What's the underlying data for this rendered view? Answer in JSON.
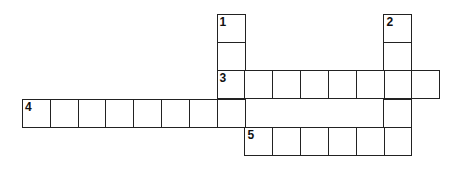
{
  "puzzle": {
    "type": "crossword",
    "grid_rows": 5,
    "grid_cols": 15,
    "entries": [
      {
        "number": "1",
        "direction": "down",
        "start_row": 0,
        "start_col": 7,
        "length": 4
      },
      {
        "number": "2",
        "direction": "down",
        "start_row": 0,
        "start_col": 13,
        "length": 5
      },
      {
        "number": "3",
        "direction": "across",
        "start_row": 2,
        "start_col": 7,
        "length": 8
      },
      {
        "number": "4",
        "direction": "across",
        "start_row": 3,
        "start_col": 0,
        "length": 8
      },
      {
        "number": "5",
        "direction": "across",
        "start_row": 4,
        "start_col": 8,
        "length": 6
      }
    ],
    "cell_values": {}
  }
}
